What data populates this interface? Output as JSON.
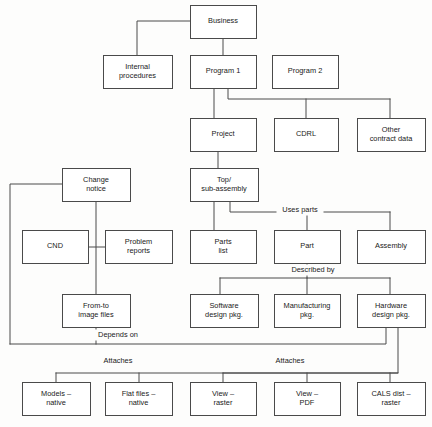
{
  "diagram": {
    "type": "hierarchical-block-diagram",
    "canvas": {
      "width": 432,
      "height": 427
    },
    "style": {
      "background_color": "#fdfdfc",
      "box_fill": "#ffffff",
      "line_color": "#4a4a4a",
      "text_color": "#1a1a1a"
    },
    "nodes": [
      {
        "id": "business",
        "label": "Business",
        "lines": [
          "Business"
        ],
        "x": 190,
        "y": 5,
        "w": 66,
        "h": 33
      },
      {
        "id": "internal-procedures",
        "label": "Internal procedures",
        "lines": [
          "Internal",
          "procedures"
        ],
        "x": 103,
        "y": 55,
        "w": 69,
        "h": 33
      },
      {
        "id": "program-1",
        "label": "Program 1",
        "lines": [
          "Program 1"
        ],
        "x": 190,
        "y": 55,
        "w": 66,
        "h": 33
      },
      {
        "id": "program-2",
        "label": "Program 2",
        "lines": [
          "Program 2"
        ],
        "x": 272,
        "y": 55,
        "w": 66,
        "h": 33
      },
      {
        "id": "project",
        "label": "Project",
        "lines": [
          "Project"
        ],
        "x": 190,
        "y": 118,
        "w": 66,
        "h": 33
      },
      {
        "id": "cdrl",
        "label": "CDRL",
        "lines": [
          "CDRL"
        ],
        "x": 274,
        "y": 118,
        "w": 64,
        "h": 33
      },
      {
        "id": "other-contract-data",
        "label": "Other contract data",
        "lines": [
          "Other",
          "contract data"
        ],
        "x": 357,
        "y": 118,
        "w": 68,
        "h": 33
      },
      {
        "id": "change-notice",
        "label": "Change notice",
        "lines": [
          "Change",
          "notice"
        ],
        "x": 62,
        "y": 168,
        "w": 68,
        "h": 33
      },
      {
        "id": "top-sub-assembly",
        "label": "Top/ sub-assembly",
        "lines": [
          "Top/",
          "sub-assembly"
        ],
        "x": 190,
        "y": 168,
        "w": 68,
        "h": 33
      },
      {
        "id": "cnd",
        "label": "CND",
        "lines": [
          "CND"
        ],
        "x": 22,
        "y": 230,
        "w": 66,
        "h": 33
      },
      {
        "id": "problem-reports",
        "label": "Problem reports",
        "lines": [
          "Problem",
          "reports"
        ],
        "x": 105,
        "y": 230,
        "w": 67,
        "h": 33
      },
      {
        "id": "parts-list",
        "label": "Parts list",
        "lines": [
          "Parts",
          "list"
        ],
        "x": 190,
        "y": 230,
        "w": 66,
        "h": 33
      },
      {
        "id": "part",
        "label": "Part",
        "lines": [
          "Part"
        ],
        "x": 274,
        "y": 230,
        "w": 66,
        "h": 33
      },
      {
        "id": "assembly",
        "label": "Assembly",
        "lines": [
          "Assembly"
        ],
        "x": 357,
        "y": 230,
        "w": 68,
        "h": 33
      },
      {
        "id": "from-to-image-files",
        "label": "From-to image files",
        "lines": [
          "From-to",
          "image files"
        ],
        "x": 62,
        "y": 294,
        "w": 68,
        "h": 33
      },
      {
        "id": "software-design-pkg",
        "label": "Software design pkg.",
        "lines": [
          "Software",
          "design pkg."
        ],
        "x": 190,
        "y": 294,
        "w": 68,
        "h": 33
      },
      {
        "id": "manufacturing-pkg",
        "label": "Manufacturing pkg.",
        "lines": [
          "Manufacturing",
          "pkg."
        ],
        "x": 274,
        "y": 294,
        "w": 66,
        "h": 33
      },
      {
        "id": "hardware-design-pkg",
        "label": "Hardware design pkg.",
        "lines": [
          "Hardware",
          "design pkg."
        ],
        "x": 357,
        "y": 294,
        "w": 68,
        "h": 33
      },
      {
        "id": "models-native",
        "label": "Models – native",
        "lines": [
          "Models –",
          "native"
        ],
        "x": 22,
        "y": 382,
        "w": 68,
        "h": 33
      },
      {
        "id": "flat-files-native",
        "label": "Flat files – native",
        "lines": [
          "Flat files –",
          "native"
        ],
        "x": 105,
        "y": 382,
        "w": 67,
        "h": 33
      },
      {
        "id": "view-raster",
        "label": "View – raster",
        "lines": [
          "View –",
          "raster"
        ],
        "x": 190,
        "y": 382,
        "w": 66,
        "h": 33
      },
      {
        "id": "view-pdf",
        "label": "View – PDF",
        "lines": [
          "View –",
          "PDF"
        ],
        "x": 274,
        "y": 382,
        "w": 66,
        "h": 33
      },
      {
        "id": "cals-dist-raster",
        "label": "CALS dist – raster",
        "lines": [
          "CALS dist –",
          "raster"
        ],
        "x": 357,
        "y": 382,
        "w": 68,
        "h": 33
      }
    ],
    "edge_labels": [
      {
        "id": "uses-parts",
        "text": "Uses parts",
        "x": 300,
        "y": 210
      },
      {
        "id": "described-by",
        "text": "Described by",
        "x": 313,
        "y": 270
      },
      {
        "id": "depends-on",
        "text": "Depends on",
        "x": 118,
        "y": 335
      },
      {
        "id": "attaches-left",
        "text": "Attaches",
        "x": 118,
        "y": 361
      },
      {
        "id": "attaches-right",
        "text": "Attaches",
        "x": 290,
        "y": 361
      }
    ],
    "connections": [
      {
        "id": "business-to-internal-procedures",
        "from": "business",
        "to": "internal-procedures",
        "path": "M190,21 L137,21 L137,55"
      },
      {
        "id": "business-to-program-1",
        "from": "business",
        "to": "program-1",
        "path": "M223,38 L223,55"
      },
      {
        "id": "program-1-to-project",
        "from": "program-1",
        "to": "project",
        "path": "M214,88 L214,118"
      },
      {
        "id": "program-1-bus",
        "from": "program-1",
        "to": "cdrl-and-other",
        "path": "M228,88 L228,99 L390,99"
      },
      {
        "id": "bus-to-cdrl",
        "from": "program-1-bus",
        "to": "cdrl",
        "path": "M306,99 L306,118"
      },
      {
        "id": "bus-to-other-contract-data",
        "from": "program-1-bus",
        "to": "other-contract-data",
        "path": "M390,99 L390,118"
      },
      {
        "id": "project-to-top-sub-assembly",
        "from": "project",
        "to": "top-sub-assembly",
        "path": "M218,151 L218,168"
      },
      {
        "id": "top-sub-assembly-to-parts-list",
        "from": "top-sub-assembly",
        "to": "parts-list",
        "path": "M214,201 L214,230"
      },
      {
        "id": "uses-parts-bus",
        "from": "top-sub-assembly",
        "to": "part-and-assembly",
        "path": "M230,201 L230,212 L390,212"
      },
      {
        "id": "uses-parts-to-part",
        "from": "uses-parts-bus",
        "to": "part",
        "path": "M307,212 L307,230"
      },
      {
        "id": "uses-parts-to-assembly",
        "from": "uses-parts-bus",
        "to": "assembly",
        "path": "M390,212 L390,230"
      },
      {
        "id": "described-by-bus",
        "from": "part",
        "to": "design-packages",
        "path": "M307,263 L307,278 M220,278 L390,278"
      },
      {
        "id": "described-by-to-software",
        "from": "described-by-bus",
        "to": "software-design-pkg",
        "path": "M220,278 L220,294"
      },
      {
        "id": "described-by-to-manufacturing",
        "from": "described-by-bus",
        "to": "manufacturing-pkg",
        "path": "M307,278 L307,294"
      },
      {
        "id": "described-by-to-hardware",
        "from": "described-by-bus",
        "to": "hardware-design-pkg",
        "path": "M390,278 L390,294"
      },
      {
        "id": "change-notice-left-feed",
        "from": "depends-on-bus",
        "to": "change-notice",
        "path": "M62,184 L10,184 L10,344"
      },
      {
        "id": "change-notice-down",
        "from": "change-notice",
        "to": "from-to-image-files",
        "path": "M96,201 L96,294"
      },
      {
        "id": "cnd-to-problem-reports",
        "from": "cnd",
        "to": "problem-reports",
        "path": "M88,247 L105,247"
      },
      {
        "id": "depends-on-bus",
        "from": "from-to-image-files",
        "to": "hardware-design-pkg",
        "path": "M96,327 L96,344 M10,344 L386,344 L386,327"
      },
      {
        "id": "hardware-to-attaches-bus",
        "from": "hardware-design-pkg",
        "to": "attaches-bus",
        "path": "M398,327 L398,373 L223,373"
      },
      {
        "id": "attaches-bus",
        "from": "attaches-bus",
        "to": "bottom-row",
        "path": "M56,373 L398,373"
      },
      {
        "id": "attaches-drop-models",
        "from": "attaches-bus",
        "to": "models-native",
        "path": "M56,373 L56,382"
      },
      {
        "id": "attaches-drop-flat-files",
        "from": "attaches-bus",
        "to": "flat-files-native",
        "path": "M139,373 L139,382"
      },
      {
        "id": "attaches-drop-view-raster",
        "from": "attaches-bus",
        "to": "view-raster",
        "path": "M223,373 L223,382"
      },
      {
        "id": "attaches-drop-view-pdf",
        "from": "attaches-bus",
        "to": "view-pdf",
        "path": "M307,373 L307,382"
      },
      {
        "id": "attaches-drop-cals",
        "from": "attaches-bus",
        "to": "cals-dist-raster",
        "path": "M390,373 L390,382"
      }
    ]
  }
}
